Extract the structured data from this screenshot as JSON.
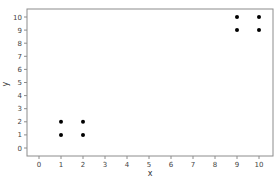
{
  "chart_data": {
    "type": "scatter",
    "title": "",
    "xlabel": "x",
    "ylabel": "y",
    "xlim": [
      -0.5,
      10.5
    ],
    "ylim": [
      -0.5,
      10.5
    ],
    "xticks": [
      0,
      1,
      2,
      3,
      4,
      5,
      6,
      7,
      8,
      9,
      10
    ],
    "yticks": [
      0,
      1,
      2,
      3,
      4,
      5,
      6,
      7,
      8,
      9,
      10
    ],
    "grid": false,
    "legend": null,
    "series": [
      {
        "name": "points",
        "color": "#000000",
        "points": [
          {
            "x": 1,
            "y": 1
          },
          {
            "x": 1,
            "y": 2
          },
          {
            "x": 2,
            "y": 1
          },
          {
            "x": 2,
            "y": 2
          },
          {
            "x": 9,
            "y": 9
          },
          {
            "x": 9,
            "y": 10
          },
          {
            "x": 10,
            "y": 9
          },
          {
            "x": 10,
            "y": 10
          }
        ]
      }
    ]
  },
  "colors": {
    "frame": "#8c8c8c",
    "tick_text": "#444444",
    "marker": "#000000"
  }
}
